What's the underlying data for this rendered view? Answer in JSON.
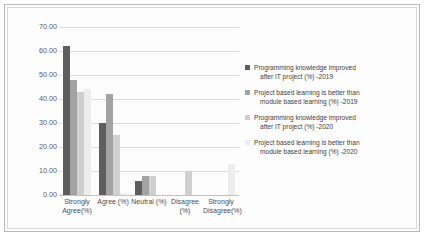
{
  "chart_data": {
    "type": "bar",
    "title": "",
    "xlabel": "",
    "ylabel": "",
    "ylim": [
      0,
      70
    ],
    "ytick_labels": [
      "70.00",
      "60.00",
      "50.00",
      "40.00",
      "30.00",
      "20.00",
      "10.00",
      "0.00"
    ],
    "grid": true,
    "legend_position": "right",
    "categories": [
      "Strongly Agree(%)",
      "Agree (%)",
      "Neutral (%)",
      "Disagree (%)",
      "Strongly Disagree(%)"
    ],
    "series": [
      {
        "name": "Programming knowledge improved after IT project (%) -2019",
        "color": "#5e5e5e",
        "values": [
          62,
          30,
          6,
          0,
          0
        ]
      },
      {
        "name": "Project based learning is better than module based learning (%) -2019",
        "color": "#a3a3a3",
        "values": [
          48,
          42,
          8,
          0,
          0
        ]
      },
      {
        "name": "Programming knowledge improved after IT project (%) -2020",
        "color": "#cfcfcf",
        "values": [
          43,
          25,
          8,
          10,
          0
        ]
      },
      {
        "name": "Project based learning is better than module based learning (%) -2020",
        "color": "#ededed",
        "values": [
          44,
          1,
          0,
          0,
          13
        ]
      }
    ],
    "legend": [
      {
        "line1": "Programming knowledge improved",
        "line2": "after IT project (%) -2019",
        "color": "#5e5e5e"
      },
      {
        "line1": "Project based learning is better than",
        "line2": "module based learning (%) -2019",
        "color": "#a3a3a3"
      },
      {
        "line1": "Programming knowledge improved",
        "line2": "after IT project (%) -2020",
        "color": "#cfcfcf"
      },
      {
        "line1": "Project based learning is better than",
        "line2": "module based learning (%) -2020",
        "color": "#ededed"
      }
    ]
  }
}
